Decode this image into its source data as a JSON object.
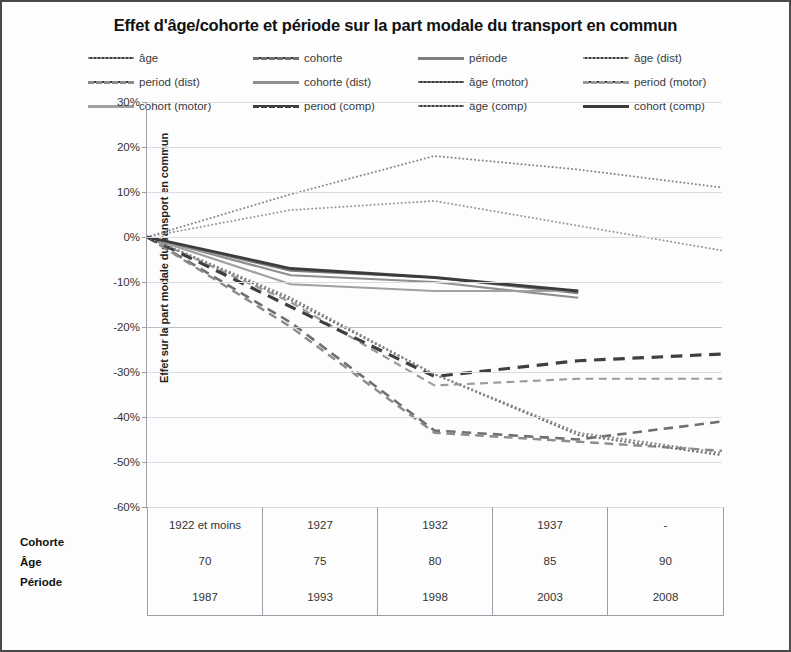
{
  "chart_data": {
    "type": "line",
    "title": "Effet d'âge/cohorte et période sur la part modale du transport en commun",
    "xlabel": "",
    "ylabel": "Effet sur la part modale du transport en commun",
    "ylim": [
      -60,
      30
    ],
    "ytick_labels": [
      "30%",
      "20%",
      "10%",
      "0%",
      "-10%",
      "-20%",
      "-30%",
      "-40%",
      "-50%",
      "-60%"
    ],
    "ytick_values": [
      30,
      20,
      10,
      0,
      -10,
      -20,
      -30,
      -40,
      -50,
      -60
    ],
    "grid": true,
    "legend_position": "top",
    "x_categories": [
      "1",
      "2",
      "3",
      "4",
      "5"
    ],
    "x_table": {
      "row_labels": [
        "Cohorte",
        "Âge",
        "Période"
      ],
      "rows": [
        [
          "1922 et moins",
          "1927",
          "1932",
          "1937",
          "-"
        ],
        [
          "70",
          "75",
          "80",
          "85",
          "90"
        ],
        [
          "1987",
          "1993",
          "1998",
          "2003",
          "2008"
        ]
      ]
    },
    "series": [
      {
        "name": "âge",
        "style": "dotted",
        "color": "#8a8a8a",
        "width": 2.0,
        "values": [
          0,
          9.5,
          18,
          15,
          11
        ]
      },
      {
        "name": "cohorte",
        "style": "dashed",
        "color": "#6f6f6f",
        "width": 2.6,
        "values": [
          0,
          -19,
          -43,
          -45,
          -41
        ]
      },
      {
        "name": "période",
        "style": "solid",
        "color": "#7d7d7d",
        "width": 2.2,
        "values": [
          0,
          -7.5,
          -9,
          -12.5,
          null
        ]
      },
      {
        "name": "âge (dist)",
        "style": "dotted",
        "color": "#9a9a9a",
        "width": 2.0,
        "values": [
          0,
          6,
          8,
          2.5,
          -3
        ]
      },
      {
        "name": "period (dist)",
        "style": "dashed",
        "color": "#8c8c8c",
        "width": 2.4,
        "values": [
          0,
          -20,
          -43.5,
          -45.5,
          -47.5
        ]
      },
      {
        "name": "cohorte (dist)",
        "style": "solid",
        "color": "#8f8f8f",
        "width": 2.2,
        "values": [
          0,
          -8.5,
          -10,
          -13.5,
          null
        ]
      },
      {
        "name": "âge (motor)",
        "style": "dotted",
        "color": "#707070",
        "width": 2.2,
        "values": [
          0,
          -14,
          -30.5,
          -44,
          -48.5
        ]
      },
      {
        "name": "period (motor)",
        "style": "dashed",
        "color": "#9b9b9b",
        "width": 2.2,
        "values": [
          0,
          -14.5,
          -33,
          -31.5,
          -31.5
        ]
      },
      {
        "name": "cohort (motor)",
        "style": "solid",
        "color": "#a0a0a0",
        "width": 2.2,
        "values": [
          0,
          -10.5,
          -12,
          -12,
          null
        ]
      },
      {
        "name": "period (comp)",
        "style": "dashed",
        "color": "#3f3f3f",
        "width": 3.2,
        "values": [
          0,
          -15.5,
          -31,
          -27.5,
          -26
        ]
      },
      {
        "name": "âge (comp)",
        "style": "dotted",
        "color": "#8b8b8b",
        "width": 2.2,
        "values": [
          0,
          -13.5,
          -30.5,
          -43.5,
          -48
        ]
      },
      {
        "name": "cohort (comp)",
        "style": "solid",
        "color": "#3c3c3c",
        "width": 2.8,
        "values": [
          0,
          -7,
          -9,
          -12,
          null
        ]
      }
    ]
  },
  "legend": {
    "items": [
      {
        "label": "âge",
        "style": "dotted",
        "color": "#8a8a8a"
      },
      {
        "label": "cohorte",
        "style": "dashed",
        "color": "#6f6f6f"
      },
      {
        "label": "période",
        "style": "solid",
        "color": "#7d7d7d"
      },
      {
        "label": "âge (dist)",
        "style": "dotted",
        "color": "#9a9a9a"
      },
      {
        "label": "period (dist)",
        "style": "dashed",
        "color": "#8c8c8c"
      },
      {
        "label": "cohorte (dist)",
        "style": "solid",
        "color": "#8f8f8f"
      },
      {
        "label": "âge (motor)",
        "style": "dotted",
        "color": "#707070"
      },
      {
        "label": "period (motor)",
        "style": "dashed",
        "color": "#9b9b9b"
      },
      {
        "label": "cohort (motor)",
        "style": "solid",
        "color": "#a0a0a0"
      },
      {
        "label": "period (comp)",
        "style": "dashed",
        "color": "#3f3f3f"
      },
      {
        "label": "âge (comp)",
        "style": "dotted",
        "color": "#8b8b8b"
      },
      {
        "label": "cohort (comp)",
        "style": "solid",
        "color": "#3c3c3c"
      }
    ]
  }
}
